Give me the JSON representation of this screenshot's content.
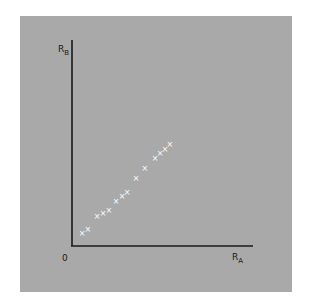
{
  "chart_data": {
    "type": "scatter",
    "title": "",
    "xlabel": "R",
    "xlabel_subscript": "A",
    "ylabel": "R",
    "ylabel_subscript": "B",
    "origin_label": "0",
    "marker": "x",
    "marker_color": "#ffffff",
    "background_color": "#a9a9a9",
    "axis_color": "#1a1a1a",
    "grid": false,
    "legend": null,
    "xlim": [
      0,
      10
    ],
    "ylim": [
      0,
      10
    ],
    "ticks": false,
    "points": [
      {
        "x": 0.55,
        "y": 0.63
      },
      {
        "x": 0.88,
        "y": 0.83
      },
      {
        "x": 1.38,
        "y": 1.46
      },
      {
        "x": 1.71,
        "y": 1.6
      },
      {
        "x": 2.04,
        "y": 1.75
      },
      {
        "x": 2.43,
        "y": 2.18
      },
      {
        "x": 2.76,
        "y": 2.43
      },
      {
        "x": 3.04,
        "y": 2.62
      },
      {
        "x": 3.54,
        "y": 3.3
      },
      {
        "x": 4.03,
        "y": 3.79
      },
      {
        "x": 4.59,
        "y": 4.27
      },
      {
        "x": 4.86,
        "y": 4.51
      },
      {
        "x": 5.14,
        "y": 4.71
      },
      {
        "x": 5.41,
        "y": 4.95
      }
    ]
  }
}
